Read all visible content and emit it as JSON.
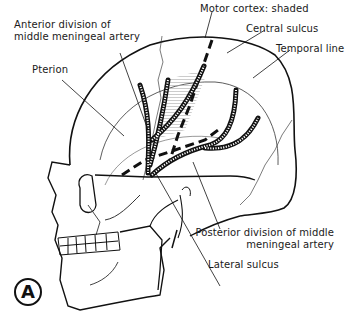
{
  "figure": {
    "panel_letter": "A"
  },
  "labels": {
    "motor_cortex": "Motor cortex: shaded",
    "anterior_division_line1": "Anterior division of",
    "anterior_division_line2": "middle meningeal artery",
    "central_sulcus": "Central sulcus",
    "temporal_line": "Temporal line",
    "pterion": "Pterion",
    "posterior_division_line1": "Posterior division of middle",
    "posterior_division_line2": "meningeal artery",
    "lateral_sulcus": "Lateral sulcus"
  },
  "colors": {
    "ink": "#111111",
    "shading": "#d8d8d8",
    "background": "#ffffff"
  }
}
